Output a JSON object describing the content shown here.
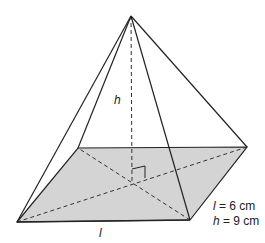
{
  "diagram": {
    "type": "square-based pyramid",
    "vertices": {
      "apex": [
        131,
        16
      ],
      "base_front_left": [
        17,
        222
      ],
      "base_front_right": [
        190,
        220
      ],
      "base_back_right": [
        247,
        147
      ],
      "base_back_left": [
        78,
        148
      ],
      "base_center": [
        132,
        182
      ]
    },
    "colors": {
      "base_fill": "#d4d4d4",
      "edge": "#222222",
      "background": "#ffffff"
    },
    "labels": {
      "height_label": "h",
      "edge_label": "l",
      "given_l_var": "l",
      "given_l_value": " = 6 cm",
      "given_h_var": "h",
      "given_h_value": " = 9 cm"
    }
  }
}
